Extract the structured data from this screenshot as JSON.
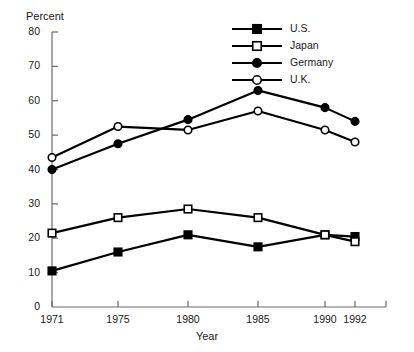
{
  "chart_data": {
    "type": "line",
    "title": "",
    "xlabel": "Year",
    "ylabel": "Percent",
    "categories": [
      "1971",
      "1975",
      "1980",
      "1985",
      "1990",
      "1992"
    ],
    "x": [
      1971,
      1975,
      1980,
      1985,
      1990,
      1992
    ],
    "ylim": [
      0,
      80
    ],
    "ytick_step": 10,
    "yticks": [
      "0",
      "10",
      "20",
      "30",
      "40",
      "50",
      "60",
      "70",
      "80"
    ],
    "grid": false,
    "legend_position": "top-right",
    "series": [
      {
        "name": "U.S.",
        "marker": "filled-square",
        "color": "#000000",
        "values": [
          10.5,
          16,
          21,
          17.5,
          21,
          20.5
        ]
      },
      {
        "name": "Japan",
        "marker": "open-square",
        "color": "#000000",
        "values": [
          21.5,
          26,
          28.5,
          26,
          21,
          19
        ]
      },
      {
        "name": "Germany",
        "marker": "filled-circle",
        "color": "#000000",
        "values": [
          40,
          47.5,
          54.5,
          63,
          58,
          54
        ]
      },
      {
        "name": "U.K.",
        "marker": "open-circle",
        "color": "#000000",
        "values": [
          43.5,
          52.5,
          51.5,
          57,
          51.5,
          48
        ]
      }
    ]
  },
  "legend": {
    "items": [
      {
        "label": "U.S."
      },
      {
        "label": "Japan"
      },
      {
        "label": "Germany"
      },
      {
        "label": "U.K."
      }
    ]
  },
  "colors": {
    "ink": "#000000",
    "axis": "#6b6b6b",
    "background": "#ffffff"
  }
}
